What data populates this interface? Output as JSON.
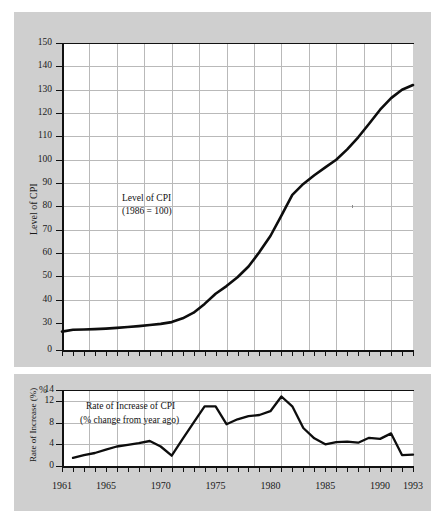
{
  "figure": {
    "background_color": "#ffffff",
    "plate_color": "#cfcfcf",
    "plot_background": "#ffffff",
    "line_color": "#0d0d0d",
    "grid_color": "#b9b9b9"
  },
  "chart_data": [
    {
      "id": "level-of-cpi",
      "type": "line",
      "title": "",
      "annotation_line1": "Level of CPI",
      "annotation_line2": "(1986 = 100)",
      "xlabel": "",
      "ylabel": "Level of CPI",
      "xlim": [
        1961,
        1993
      ],
      "ylim": [
        0,
        150
      ],
      "y_axis_break_after": 0,
      "yticks": [
        150,
        140,
        130,
        120,
        110,
        100,
        90,
        80,
        70,
        60,
        50,
        40,
        30,
        0
      ],
      "ytick_labels": [
        "150",
        "140",
        "130",
        "120",
        "110",
        "100",
        "90",
        "80",
        "70",
        "60",
        "50",
        "40",
        "30",
        "0"
      ],
      "xticks": [
        1961,
        1965,
        1970,
        1975,
        1980,
        1985,
        1990,
        1993
      ],
      "xtick_labels": [
        "1961",
        "1965",
        "1970",
        "1975",
        "1980",
        "1985",
        "1990",
        "1993"
      ],
      "grid": true,
      "grid_x_interval_years": 2.5,
      "grid_y_interval": 10,
      "x": [
        1961,
        1962,
        1963,
        1964,
        1965,
        1966,
        1967,
        1968,
        1969,
        1970,
        1971,
        1972,
        1973,
        1974,
        1975,
        1976,
        1977,
        1978,
        1979,
        1980,
        1981,
        1982,
        1983,
        1984,
        1985,
        1986,
        1987,
        1988,
        1989,
        1990,
        1991,
        1992,
        1993
      ],
      "values": [
        20.5,
        22.5,
        22.8,
        23.2,
        23.8,
        24.6,
        25.6,
        26.6,
        27.8,
        29.0,
        30.4,
        32.0,
        34.4,
        38.2,
        42.5,
        45.8,
        49.6,
        54.2,
        60.4,
        67.3,
        76.0,
        84.9,
        89.6,
        93.3,
        96.7,
        100.0,
        104.4,
        109.6,
        115.4,
        121.4,
        126.4,
        130.0,
        132.0
      ]
    },
    {
      "id": "rate-of-increase-of-cpi",
      "type": "line",
      "title": "",
      "annotation_line1": "Rate of Increase  of CPI",
      "annotation_line2": "(% change from year ago)",
      "xlabel": "",
      "ylabel": "Rate of Increase (%)",
      "unit_mark": "%",
      "xlim": [
        1961,
        1993
      ],
      "ylim": [
        0,
        14
      ],
      "yticks": [
        14,
        12,
        8,
        4,
        0
      ],
      "ytick_labels": [
        "14",
        "12",
        "8",
        "4",
        "0"
      ],
      "xticks": [
        1961,
        1965,
        1970,
        1975,
        1980,
        1985,
        1990,
        1993
      ],
      "xtick_labels": [
        "1961",
        "1965",
        "1970",
        "1975",
        "1980",
        "1985",
        "1990",
        "1993"
      ],
      "grid": true,
      "grid_x_interval_years": 2.5,
      "grid_y_ticks": [
        4,
        8,
        12
      ],
      "x": [
        1962,
        1963,
        1964,
        1965,
        1966,
        1967,
        1968,
        1969,
        1970,
        1971,
        1972,
        1973,
        1974,
        1975,
        1976,
        1977,
        1978,
        1979,
        1980,
        1981,
        1982,
        1983,
        1984,
        1985,
        1986,
        1987,
        1988,
        1989,
        1990,
        1991,
        1992,
        1993
      ],
      "values": [
        1.5,
        2.0,
        2.4,
        3.0,
        3.6,
        3.9,
        4.2,
        4.6,
        3.6,
        1.9,
        5.0,
        8.0,
        11.0,
        11.0,
        7.7,
        8.6,
        9.2,
        9.4,
        10.1,
        12.8,
        11.0,
        7.0,
        5.1,
        4.0,
        4.4,
        4.5,
        4.3,
        5.2,
        5.0,
        6.0,
        2.0,
        2.1
      ]
    }
  ]
}
